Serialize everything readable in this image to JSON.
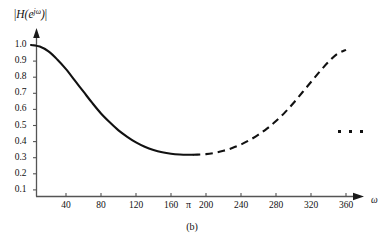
{
  "figure": {
    "caption": "(b)",
    "ellipsis_label": "continuation-dots"
  },
  "axes": {
    "y_title_parts": {
      "open_bar": "|",
      "fn": "H(e",
      "exponent": "jω",
      "close_paren": ")",
      "close_bar": "|"
    },
    "y_title_text": "|H(e^{jω})|",
    "x_title": "ω",
    "y_ticks": [
      "1.0",
      "0.9",
      "0.8",
      "0.7",
      "0.6",
      "0.5",
      "0.4",
      "0.3",
      "0.2",
      "0.1"
    ],
    "x_ticks": [
      "40",
      "80",
      "120",
      "160",
      "π",
      "200",
      "240",
      "280",
      "320",
      "360"
    ]
  },
  "chart_data": {
    "type": "line",
    "title": "",
    "subtitle": "",
    "xlabel": "ω",
    "ylabel": "|H(e^{jω})|",
    "xlim": [
      0,
      400
    ],
    "ylim": [
      0,
      1.08
    ],
    "grid": false,
    "legend": null,
    "x_tick_values": [
      40,
      80,
      120,
      160,
      180,
      200,
      240,
      280,
      320,
      360
    ],
    "x_tick_labels": [
      "40",
      "80",
      "120",
      "160",
      "π",
      "200",
      "240",
      "280",
      "320",
      "360"
    ],
    "y_tick_values": [
      1.0,
      0.9,
      0.8,
      0.7,
      0.6,
      0.5,
      0.4,
      0.3,
      0.2,
      0.1
    ],
    "y_tick_labels": [
      "1.0",
      "0.9",
      "0.8",
      "0.7",
      "0.6",
      "0.5",
      "0.4",
      "0.3",
      "0.2",
      "0.1"
    ],
    "annotations": [
      {
        "text": "(b)",
        "role": "figure-caption"
      },
      {
        "text": "· · ·",
        "role": "periodic-continuation",
        "x": 385,
        "y": 0.44
      }
    ],
    "series": [
      {
        "name": "magnitude-response-solid",
        "style": "solid",
        "x": [
          0,
          10,
          20,
          30,
          40,
          50,
          60,
          70,
          80,
          90,
          100,
          110,
          120,
          130,
          140,
          150,
          160,
          170,
          180,
          185
        ],
        "y": [
          1.0,
          0.99,
          0.96,
          0.91,
          0.85,
          0.78,
          0.71,
          0.64,
          0.575,
          0.52,
          0.47,
          0.43,
          0.395,
          0.368,
          0.348,
          0.334,
          0.325,
          0.32,
          0.318,
          0.318
        ]
      },
      {
        "name": "magnitude-response-dashed",
        "style": "dashed",
        "x": [
          185,
          190,
          200,
          210,
          220,
          230,
          240,
          250,
          260,
          270,
          280,
          290,
          300,
          310,
          320,
          330,
          340,
          350,
          360
        ],
        "y": [
          0.318,
          0.319,
          0.322,
          0.33,
          0.343,
          0.36,
          0.382,
          0.41,
          0.443,
          0.482,
          0.528,
          0.58,
          0.64,
          0.705,
          0.77,
          0.835,
          0.895,
          0.945,
          0.97
        ]
      }
    ]
  }
}
